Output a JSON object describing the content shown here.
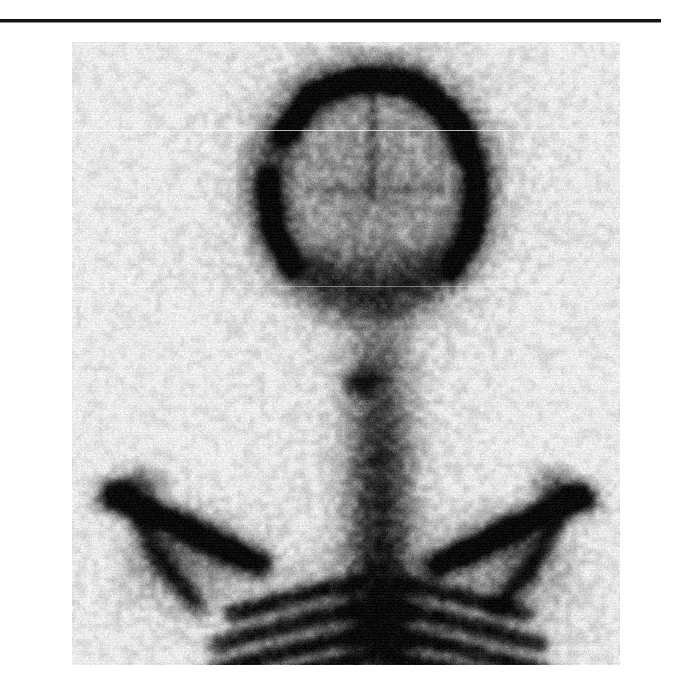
{
  "page": {
    "background_color": "#ffffff",
    "width": 689,
    "height": 700
  },
  "divider": {
    "name": "top-horizontal-rule",
    "color": "#151515",
    "visible": true
  },
  "figure": {
    "panel_label": "A",
    "modality": "bone-scintigraphy",
    "view": "posterior",
    "region": "skull-cervical-thoracic-spine-shoulders",
    "panel_background_color": "#f3f3f3",
    "tracer_uptake_color": "#1c1c1c",
    "label_color": "#131313",
    "anatomy": [
      {
        "name": "calvarium",
        "uptake": "increased-rim"
      },
      {
        "name": "skull-base",
        "uptake": "moderate"
      },
      {
        "name": "cervical-spine",
        "uptake": "intense-focal"
      },
      {
        "name": "thoracic-spine",
        "uptake": "intense"
      },
      {
        "name": "left-scapula",
        "uptake": "moderate"
      },
      {
        "name": "right-scapula",
        "uptake": "moderate"
      },
      {
        "name": "left-shoulder",
        "uptake": "focal-intense"
      },
      {
        "name": "right-shoulder",
        "uptake": "focal-intense"
      },
      {
        "name": "ribs",
        "uptake": "moderate"
      }
    ]
  }
}
